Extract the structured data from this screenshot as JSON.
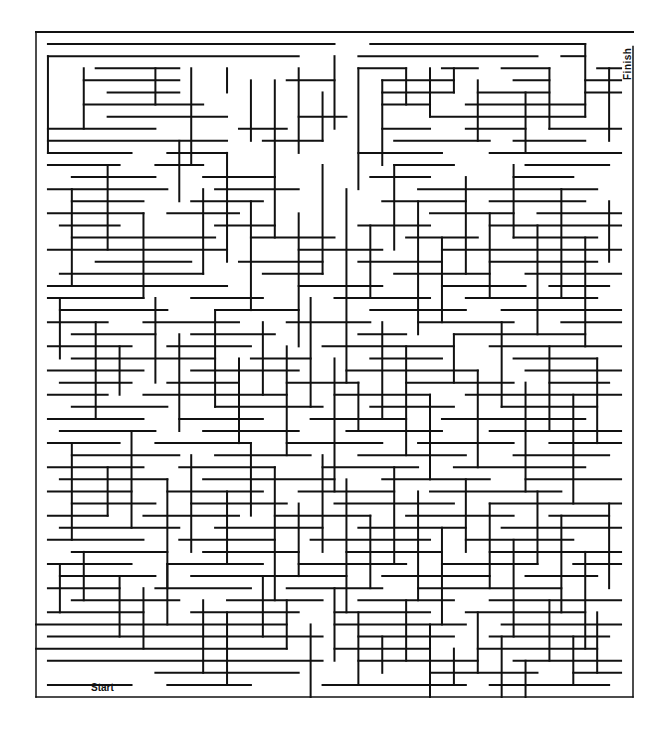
{
  "maze": {
    "origin": [
      36,
      32
    ],
    "cell": 12,
    "cols": 50,
    "rows": 55,
    "outer_box": {
      "x": 36,
      "y": 32,
      "w": 597,
      "h": 665
    },
    "wall_color": "#111111",
    "background": "#ffffff",
    "labels": {
      "start": "Start",
      "finish": "Finish"
    },
    "walls_h": [
      [
        1,
        1,
        25
      ],
      [
        28,
        1,
        46
      ],
      [
        1,
        2,
        22
      ],
      [
        27,
        2,
        42
      ],
      [
        44,
        2,
        46
      ],
      [
        5,
        3,
        12
      ],
      [
        27,
        3,
        31
      ],
      [
        34,
        3,
        37
      ],
      [
        39,
        3,
        43
      ],
      [
        47,
        3,
        49
      ],
      [
        4,
        4,
        12
      ],
      [
        21,
        4,
        25
      ],
      [
        29,
        4,
        35
      ],
      [
        40,
        4,
        43
      ],
      [
        46,
        4,
        49
      ],
      [
        6,
        5,
        12
      ],
      [
        29,
        5,
        35
      ],
      [
        37,
        5,
        43
      ],
      [
        46,
        5,
        49
      ],
      [
        4,
        6,
        14
      ],
      [
        29,
        6,
        33
      ],
      [
        36,
        6,
        46
      ],
      [
        6,
        7,
        16
      ],
      [
        22,
        7,
        26
      ],
      [
        33,
        7,
        46
      ],
      [
        1,
        8,
        10
      ],
      [
        17,
        8,
        21
      ],
      [
        29,
        8,
        33
      ],
      [
        36,
        8,
        41
      ],
      [
        43,
        8,
        49
      ],
      [
        1,
        9,
        16
      ],
      [
        19,
        9,
        24
      ],
      [
        30,
        9,
        38
      ],
      [
        40,
        9,
        46
      ],
      [
        1,
        10,
        8
      ],
      [
        11,
        10,
        16
      ],
      [
        27,
        10,
        34
      ],
      [
        38,
        10,
        49
      ],
      [
        1,
        11,
        7
      ],
      [
        10,
        11,
        14
      ],
      [
        30,
        11,
        35
      ],
      [
        41,
        11,
        48
      ],
      [
        3,
        12,
        10
      ],
      [
        14,
        12,
        20
      ],
      [
        28,
        12,
        33
      ],
      [
        40,
        12,
        45
      ],
      [
        1,
        13,
        11
      ],
      [
        15,
        13,
        22
      ],
      [
        32,
        13,
        47
      ],
      [
        3,
        14,
        9
      ],
      [
        13,
        14,
        19
      ],
      [
        29,
        14,
        36
      ],
      [
        38,
        14,
        46
      ],
      [
        1,
        15,
        9
      ],
      [
        11,
        15,
        17
      ],
      [
        33,
        15,
        40
      ],
      [
        42,
        15,
        49
      ],
      [
        2,
        16,
        7
      ],
      [
        15,
        16,
        20
      ],
      [
        27,
        16,
        33
      ],
      [
        38,
        16,
        49
      ],
      [
        3,
        17,
        15
      ],
      [
        18,
        17,
        25
      ],
      [
        31,
        17,
        37
      ],
      [
        40,
        17,
        47
      ],
      [
        1,
        18,
        16
      ],
      [
        22,
        18,
        29
      ],
      [
        34,
        18,
        49
      ],
      [
        5,
        19,
        13
      ],
      [
        17,
        19,
        24
      ],
      [
        27,
        19,
        34
      ],
      [
        38,
        19,
        47
      ],
      [
        2,
        20,
        14
      ],
      [
        19,
        20,
        24
      ],
      [
        30,
        20,
        38
      ],
      [
        41,
        20,
        49
      ],
      [
        1,
        21,
        16
      ],
      [
        22,
        21,
        29
      ],
      [
        34,
        21,
        41
      ],
      [
        43,
        21,
        48
      ],
      [
        1,
        22,
        9
      ],
      [
        13,
        22,
        19
      ],
      [
        25,
        22,
        33
      ],
      [
        36,
        22,
        47
      ],
      [
        2,
        23,
        11
      ],
      [
        15,
        23,
        22
      ],
      [
        28,
        23,
        36
      ],
      [
        39,
        23,
        49
      ],
      [
        1,
        24,
        6
      ],
      [
        9,
        24,
        17
      ],
      [
        21,
        24,
        28
      ],
      [
        32,
        24,
        40
      ],
      [
        44,
        24,
        49
      ],
      [
        3,
        25,
        10
      ],
      [
        13,
        25,
        20
      ],
      [
        27,
        25,
        31
      ],
      [
        35,
        25,
        46
      ],
      [
        1,
        26,
        8
      ],
      [
        11,
        26,
        18
      ],
      [
        24,
        26,
        35
      ],
      [
        38,
        26,
        49
      ],
      [
        3,
        27,
        15
      ],
      [
        18,
        27,
        23
      ],
      [
        28,
        27,
        34
      ],
      [
        40,
        27,
        47
      ],
      [
        1,
        28,
        9
      ],
      [
        13,
        28,
        22
      ],
      [
        26,
        28,
        37
      ],
      [
        41,
        28,
        49
      ],
      [
        2,
        29,
        8
      ],
      [
        11,
        29,
        17
      ],
      [
        21,
        29,
        27
      ],
      [
        31,
        29,
        40
      ],
      [
        43,
        29,
        48
      ],
      [
        1,
        30,
        6
      ],
      [
        9,
        30,
        21
      ],
      [
        25,
        30,
        33
      ],
      [
        36,
        30,
        49
      ],
      [
        3,
        31,
        11
      ],
      [
        15,
        31,
        24
      ],
      [
        28,
        31,
        35
      ],
      [
        39,
        31,
        47
      ],
      [
        1,
        32,
        9
      ],
      [
        12,
        32,
        19
      ],
      [
        23,
        32,
        31
      ],
      [
        34,
        32,
        46
      ],
      [
        2,
        33,
        10
      ],
      [
        14,
        33,
        22
      ],
      [
        26,
        33,
        34
      ],
      [
        38,
        33,
        49
      ],
      [
        1,
        34,
        7
      ],
      [
        10,
        34,
        18
      ],
      [
        21,
        34,
        29
      ],
      [
        32,
        34,
        40
      ],
      [
        43,
        34,
        49
      ],
      [
        3,
        35,
        12
      ],
      [
        15,
        35,
        23
      ],
      [
        27,
        35,
        36
      ],
      [
        40,
        35,
        48
      ],
      [
        1,
        36,
        9
      ],
      [
        12,
        36,
        20
      ],
      [
        24,
        36,
        32
      ],
      [
        35,
        36,
        46
      ],
      [
        2,
        37,
        11
      ],
      [
        14,
        37,
        25
      ],
      [
        29,
        37,
        38
      ],
      [
        41,
        37,
        49
      ],
      [
        1,
        38,
        8
      ],
      [
        11,
        38,
        19
      ],
      [
        22,
        38,
        30
      ],
      [
        33,
        38,
        44
      ],
      [
        3,
        39,
        10
      ],
      [
        13,
        39,
        21
      ],
      [
        25,
        39,
        35
      ],
      [
        38,
        39,
        49
      ],
      [
        1,
        40,
        6
      ],
      [
        9,
        40,
        17
      ],
      [
        20,
        40,
        28
      ],
      [
        31,
        40,
        40
      ],
      [
        43,
        40,
        48
      ],
      [
        2,
        41,
        12
      ],
      [
        15,
        41,
        24
      ],
      [
        27,
        41,
        36
      ],
      [
        39,
        41,
        49
      ],
      [
        1,
        42,
        9
      ],
      [
        12,
        42,
        20
      ],
      [
        23,
        42,
        33
      ],
      [
        36,
        42,
        45
      ],
      [
        3,
        43,
        11
      ],
      [
        14,
        43,
        22
      ],
      [
        26,
        43,
        34
      ],
      [
        38,
        43,
        49
      ],
      [
        1,
        44,
        8
      ],
      [
        11,
        44,
        19
      ],
      [
        22,
        44,
        31
      ],
      [
        34,
        44,
        42
      ],
      [
        45,
        44,
        49
      ],
      [
        2,
        45,
        10
      ],
      [
        13,
        45,
        26
      ],
      [
        29,
        45,
        38
      ],
      [
        41,
        45,
        47
      ],
      [
        1,
        46,
        7
      ],
      [
        10,
        46,
        18
      ],
      [
        21,
        46,
        29
      ],
      [
        32,
        46,
        44
      ],
      [
        3,
        47,
        12
      ],
      [
        16,
        47,
        24
      ],
      [
        27,
        47,
        35
      ],
      [
        38,
        47,
        49
      ],
      [
        1,
        48,
        9
      ],
      [
        13,
        48,
        22
      ],
      [
        25,
        48,
        33
      ],
      [
        36,
        48,
        46
      ],
      [
        0,
        49,
        21
      ],
      [
        25,
        49,
        36
      ],
      [
        39,
        49,
        49
      ],
      [
        1,
        50,
        24
      ],
      [
        27,
        50,
        35
      ],
      [
        38,
        50,
        48
      ],
      [
        0,
        51,
        21
      ],
      [
        25,
        51,
        33
      ],
      [
        37,
        51,
        47
      ],
      [
        1,
        52,
        24
      ],
      [
        27,
        52,
        37
      ],
      [
        40,
        52,
        49
      ],
      [
        10,
        53,
        22
      ],
      [
        33,
        53,
        42
      ],
      [
        45,
        53,
        49
      ],
      [
        1,
        54,
        8
      ],
      [
        11,
        54,
        18
      ],
      [
        24,
        54,
        36
      ],
      [
        38,
        54,
        48
      ]
    ],
    "walls_v": [
      [
        1,
        2,
        10
      ],
      [
        4,
        3,
        8
      ],
      [
        10,
        3,
        6
      ],
      [
        13,
        3,
        11
      ],
      [
        16,
        3,
        5
      ],
      [
        18,
        4,
        9
      ],
      [
        20,
        4,
        12
      ],
      [
        22,
        3,
        10
      ],
      [
        24,
        5,
        9
      ],
      [
        25,
        2,
        8
      ],
      [
        27,
        3,
        13
      ],
      [
        29,
        4,
        11
      ],
      [
        31,
        3,
        6
      ],
      [
        33,
        3,
        7
      ],
      [
        35,
        3,
        5
      ],
      [
        37,
        4,
        9
      ],
      [
        41,
        5,
        10
      ],
      [
        43,
        3,
        8
      ],
      [
        46,
        1,
        7
      ],
      [
        48,
        3,
        9
      ],
      [
        3,
        13,
        21
      ],
      [
        6,
        11,
        18
      ],
      [
        9,
        15,
        22
      ],
      [
        12,
        9,
        14
      ],
      [
        14,
        13,
        20
      ],
      [
        16,
        10,
        19
      ],
      [
        18,
        14,
        23
      ],
      [
        20,
        12,
        17
      ],
      [
        22,
        15,
        26
      ],
      [
        24,
        11,
        20
      ],
      [
        26,
        13,
        29
      ],
      [
        28,
        16,
        22
      ],
      [
        30,
        11,
        18
      ],
      [
        32,
        14,
        25
      ],
      [
        34,
        17,
        24
      ],
      [
        36,
        12,
        20
      ],
      [
        38,
        15,
        22
      ],
      [
        40,
        11,
        17
      ],
      [
        42,
        16,
        25
      ],
      [
        44,
        13,
        22
      ],
      [
        46,
        17,
        26
      ],
      [
        48,
        14,
        19
      ],
      [
        2,
        22,
        27
      ],
      [
        5,
        24,
        32
      ],
      [
        7,
        26,
        30
      ],
      [
        10,
        22,
        29
      ],
      [
        12,
        25,
        33
      ],
      [
        15,
        23,
        31
      ],
      [
        17,
        27,
        34
      ],
      [
        19,
        24,
        30
      ],
      [
        21,
        26,
        35
      ],
      [
        23,
        22,
        31
      ],
      [
        25,
        27,
        38
      ],
      [
        27,
        29,
        33
      ],
      [
        29,
        24,
        32
      ],
      [
        31,
        26,
        35
      ],
      [
        33,
        30,
        37
      ],
      [
        35,
        25,
        29
      ],
      [
        37,
        28,
        36
      ],
      [
        39,
        24,
        31
      ],
      [
        41,
        29,
        38
      ],
      [
        43,
        26,
        33
      ],
      [
        45,
        30,
        39
      ],
      [
        47,
        27,
        34
      ],
      [
        3,
        34,
        42
      ],
      [
        6,
        36,
        40
      ],
      [
        8,
        33,
        41
      ],
      [
        11,
        37,
        46
      ],
      [
        13,
        35,
        43
      ],
      [
        16,
        38,
        44
      ],
      [
        18,
        34,
        40
      ],
      [
        20,
        36,
        47
      ],
      [
        22,
        39,
        45
      ],
      [
        24,
        35,
        43
      ],
      [
        26,
        37,
        48
      ],
      [
        28,
        40,
        46
      ],
      [
        30,
        36,
        44
      ],
      [
        32,
        38,
        47
      ],
      [
        34,
        41,
        49
      ],
      [
        36,
        37,
        43
      ],
      [
        38,
        39,
        46
      ],
      [
        40,
        42,
        50
      ],
      [
        42,
        38,
        44
      ],
      [
        44,
        40,
        48
      ],
      [
        46,
        43,
        51
      ],
      [
        48,
        39,
        46
      ],
      [
        2,
        44,
        48
      ],
      [
        4,
        43,
        47
      ],
      [
        7,
        45,
        50
      ],
      [
        9,
        46,
        51
      ],
      [
        11,
        44,
        49
      ],
      [
        14,
        47,
        53
      ],
      [
        16,
        48,
        54
      ],
      [
        19,
        45,
        50
      ],
      [
        21,
        47,
        51
      ],
      [
        23,
        49,
        55
      ],
      [
        25,
        46,
        52
      ],
      [
        27,
        48,
        54
      ],
      [
        29,
        50,
        53
      ],
      [
        31,
        47,
        52
      ],
      [
        33,
        49,
        55
      ],
      [
        35,
        51,
        54
      ],
      [
        37,
        48,
        53
      ],
      [
        39,
        50,
        55
      ],
      [
        41,
        52,
        55
      ],
      [
        43,
        47,
        52
      ],
      [
        45,
        50,
        54
      ],
      [
        47,
        48,
        53
      ]
    ]
  }
}
